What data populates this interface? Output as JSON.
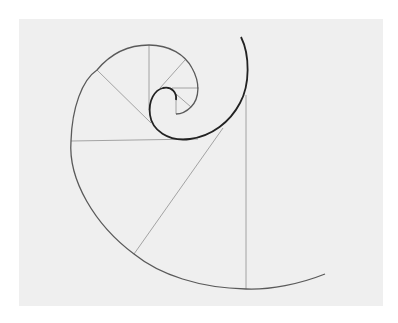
{
  "diagram": {
    "title": "Golden spiral with radial construction lines",
    "type": "logarithmic-spiral",
    "colors": {
      "background": "#ffffff",
      "panel": "#efefef",
      "spiral": "#4a4a4a",
      "spiral_inner": "#222222",
      "construction_lines": "#9a9a9a"
    },
    "elements": [
      "spiral-curve",
      "vertical-radius-line",
      "horizontal-radius-line",
      "diagonal-radius-lines"
    ]
  }
}
